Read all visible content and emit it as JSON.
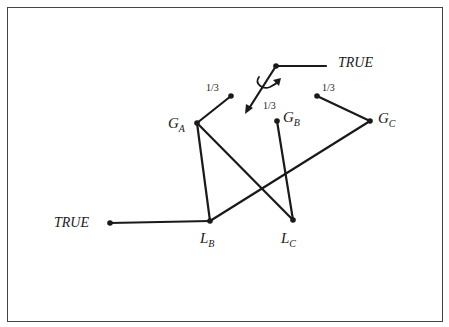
{
  "diagram": {
    "title": "",
    "labels": {
      "true_top": "TRUE",
      "true_left": "TRUE",
      "frac_a": "1/3",
      "frac_center": "1/3",
      "frac_c": "1/3",
      "ga": "G",
      "ga_sub": "A",
      "gb": "G",
      "gb_sub": "B",
      "gc": "G",
      "gc_sub": "C",
      "lb": "L",
      "lb_sub": "B",
      "lc": "L",
      "lc_sub": "C"
    },
    "nodes": [
      {
        "id": "top_true_node",
        "x": 276,
        "y": 66
      },
      {
        "id": "left_true_node",
        "x": 110,
        "y": 223
      },
      {
        "id": "GA",
        "x": 197,
        "y": 123
      },
      {
        "id": "GA_in",
        "x": 231,
        "y": 96
      },
      {
        "id": "GB",
        "x": 277,
        "y": 121
      },
      {
        "id": "GC",
        "x": 370,
        "y": 121
      },
      {
        "id": "GC_in",
        "x": 317,
        "y": 96
      },
      {
        "id": "LB",
        "x": 210,
        "y": 221
      },
      {
        "id": "LC",
        "x": 293,
        "y": 220
      }
    ],
    "edges": [
      {
        "from": "top_true_node",
        "to": "TRUE"
      },
      {
        "from": "left_true_node",
        "to": "LB"
      },
      {
        "from": "GA",
        "to": "GA_in"
      },
      {
        "from": "GC",
        "to": "GC_in"
      },
      {
        "from": "GA",
        "to": "LB"
      },
      {
        "from": "GA",
        "to": "LC"
      },
      {
        "from": "GB",
        "to": "LC"
      },
      {
        "from": "GC",
        "to": "LB"
      }
    ],
    "spinner": {
      "from": "top_true_node",
      "arrow_tip": [
        246,
        113
      ],
      "rotation_arrow": true
    },
    "colors": {
      "line": "#1a1a1a",
      "border": "#444444",
      "background": "#ffffff"
    }
  }
}
